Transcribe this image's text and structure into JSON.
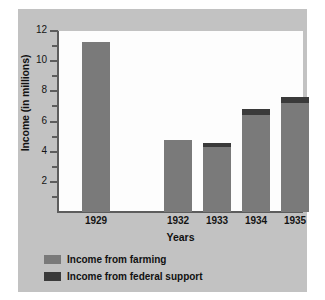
{
  "chart_data": {
    "type": "bar",
    "title": "",
    "subtitle": "",
    "xlabel": "Years",
    "ylabel": "Income (in millions)",
    "categories": [
      "1929",
      "1932",
      "1933",
      "1934",
      "1935"
    ],
    "series": [
      {
        "name": "Income from farming",
        "color": "#7a7a7a",
        "values": [
          11.3,
          4.75,
          4.3,
          6.4,
          7.25
        ]
      },
      {
        "name": "Income from federal support",
        "color": "#3a3a3a",
        "values": [
          0,
          0,
          0.25,
          0.4,
          0.4
        ]
      }
    ],
    "totals": [
      11.3,
      4.75,
      4.55,
      6.8,
      7.65
    ],
    "stacked": true,
    "ylim": [
      0,
      12
    ],
    "y_major_ticks": [
      2,
      4,
      6,
      8,
      10,
      12
    ],
    "y_minor_ticks": [
      1,
      3,
      5,
      7,
      9,
      11
    ],
    "y_tick_labels": [
      "2",
      "4",
      "6",
      "8",
      "10",
      "12"
    ],
    "grid": false,
    "legend_position": "bottom-left",
    "category_gap_after": "1929",
    "background_color": "#c2c2c2",
    "plot_background_color": "#fdfdfd",
    "axis_color": "#5d5d5d"
  },
  "legend": {
    "items": [
      {
        "label": "Income from farming",
        "color": "#7a7a7a"
      },
      {
        "label": "Income from federal support",
        "color": "#3a3a3a"
      }
    ]
  }
}
